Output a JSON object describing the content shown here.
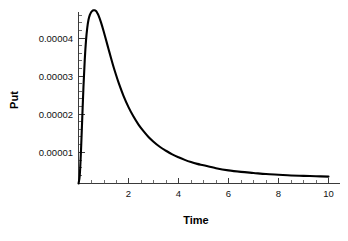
{
  "chart_data": {
    "type": "line",
    "title": "",
    "xlabel": "Time",
    "ylabel": "Put",
    "xlim": [
      0,
      10.3
    ],
    "ylim": [
      0,
      4.78e-05
    ],
    "grid": false,
    "legend": null,
    "x_ticks": [
      {
        "value": 2,
        "label": "2"
      },
      {
        "value": 4,
        "label": "4"
      },
      {
        "value": 6,
        "label": "6"
      },
      {
        "value": 8,
        "label": "8"
      },
      {
        "value": 10,
        "label": "10"
      }
    ],
    "x_minor_ticks": [
      0.5,
      1,
      1.5,
      2.5,
      3,
      3.5,
      4.5,
      5,
      5.5,
      6.5,
      7,
      7.5,
      8.5,
      9,
      9.5
    ],
    "y_ticks": [
      {
        "value": 1e-05,
        "label": "0.00001"
      },
      {
        "value": 2e-05,
        "label": "0.00002"
      },
      {
        "value": 3e-05,
        "label": "0.00003"
      },
      {
        "value": 4e-05,
        "label": "0.00004"
      }
    ],
    "y_minor_ticks": [
      2e-06,
      4e-06,
      6e-06,
      8e-06,
      1.2e-05,
      1.4e-05,
      1.6e-05,
      1.8e-05,
      2.2e-05,
      2.4e-05,
      2.6e-05,
      2.8e-05,
      3.2e-05,
      3.4e-05,
      3.6e-05,
      3.8e-05,
      4.2e-05,
      4.4e-05,
      4.6e-05
    ],
    "series": [
      {
        "name": "Put",
        "color": "#000000",
        "x": [
          0.0,
          0.05,
          0.1,
          0.15,
          0.2,
          0.25,
          0.3,
          0.35,
          0.4,
          0.45,
          0.5,
          0.55,
          0.6,
          0.65,
          0.7,
          0.75,
          0.8,
          0.9,
          1.0,
          1.1,
          1.2,
          1.3,
          1.4,
          1.5,
          1.6,
          1.8,
          2.0,
          2.2,
          2.4,
          2.6,
          2.8,
          3.0,
          3.25,
          3.5,
          3.75,
          4.0,
          4.25,
          4.5,
          4.75,
          5.0,
          5.5,
          6.0,
          6.5,
          7.0,
          7.5,
          8.0,
          8.5,
          9.0,
          9.5,
          10.0
        ],
        "y": [
          0.0,
          2.2e-06,
          9.1e-06,
          1.8e-05,
          2.68e-05,
          3.4e-05,
          3.93e-05,
          4.28e-05,
          4.5e-05,
          4.63e-05,
          4.7e-05,
          4.74e-05,
          4.76e-05,
          4.76e-05,
          4.74e-05,
          4.69e-05,
          4.62e-05,
          4.43e-05,
          4.2e-05,
          3.95e-05,
          3.7e-05,
          3.45e-05,
          3.21e-05,
          2.99e-05,
          2.78e-05,
          2.41e-05,
          2.1e-05,
          1.84e-05,
          1.62e-05,
          1.44e-05,
          1.28e-05,
          1.15e-05,
          1.01e-05,
          9e-06,
          8e-06,
          7.2e-06,
          6.5e-06,
          5.9e-06,
          5.4e-06,
          5e-06,
          4.2e-06,
          3.6e-06,
          3.2e-06,
          2.9e-06,
          2.6e-06,
          2.4e-06,
          2.2e-06,
          2.1e-06,
          2e-06,
          1.9e-06
        ]
      }
    ],
    "peak": {
      "x": 0.62,
      "y": 4.76e-05
    }
  },
  "labels": {
    "y_axis_title": "Put",
    "x_axis_title": "Time",
    "y_tick_0": "0.00001",
    "y_tick_1": "0.00002",
    "y_tick_2": "0.00003",
    "y_tick_3": "0.00004",
    "x_tick_0": "2",
    "x_tick_1": "4",
    "x_tick_2": "6",
    "x_tick_3": "8",
    "x_tick_4": "10"
  },
  "colors": {
    "background": "#ffffff",
    "curve": "#000000",
    "axis": "#3a3a3a",
    "text": "#111111"
  }
}
